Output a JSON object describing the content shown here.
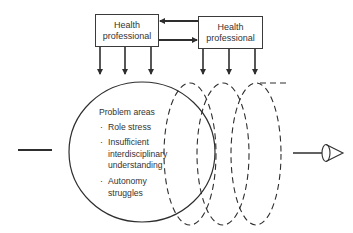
{
  "diagram": {
    "boxes": [
      {
        "label_line1": "Health",
        "label_line2": "professional"
      },
      {
        "label_line1": "Health",
        "label_line2": "professional"
      }
    ],
    "problem_areas": {
      "title": "Problem areas",
      "bullet": "·",
      "items": [
        {
          "lines": [
            "Role stress"
          ]
        },
        {
          "lines": [
            "Insufficient",
            "interdisciplinary",
            "understanding"
          ]
        },
        {
          "lines": [
            "Autonomy",
            "struggles"
          ]
        }
      ]
    },
    "connectors": {
      "box_to_box_top": "arrow pointing left",
      "box_to_box_bottom": "arrow pointing right",
      "down_arrows_per_box": 3
    },
    "spiral": {
      "solid_loops": 1,
      "dashed_loops": 3
    },
    "input_line": "horizontal line entering from left",
    "output_symbol": "eye-icon"
  },
  "colors": {
    "stroke": "#2e2e2e",
    "text": "#333333",
    "background": "#ffffff"
  }
}
